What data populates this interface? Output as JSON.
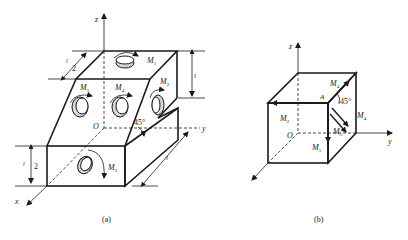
{
  "figure_a": {
    "caption": "(a)",
    "axes": {
      "x": "x",
      "y": "y",
      "z": "z",
      "origin": "O"
    },
    "moments": [
      {
        "name": "M",
        "sub": "1"
      },
      {
        "name": "M",
        "sub": "2"
      },
      {
        "name": "M",
        "sub": "3"
      },
      {
        "name": "M",
        "sub": "4"
      },
      {
        "name": "M",
        "sub": "5"
      }
    ],
    "angle": "45°",
    "dimensions": {
      "length": "l",
      "half_top": "l",
      "half_top_den": "2",
      "half_left": "l",
      "half_left_den": "2",
      "height_right": "l",
      "bottom_right": "l"
    }
  },
  "figure_b": {
    "caption": "(b)",
    "axes": {
      "x": "x",
      "y": "y",
      "z": "z",
      "origin": "O"
    },
    "point": "A",
    "angle": "45°",
    "moments": [
      {
        "name": "M",
        "sub": "1"
      },
      {
        "name": "M",
        "sub": "2"
      },
      {
        "name": "M",
        "sub": "4"
      },
      {
        "name": "M",
        "sub": "4"
      },
      {
        "name": "M",
        "sub": "5"
      }
    ]
  }
}
